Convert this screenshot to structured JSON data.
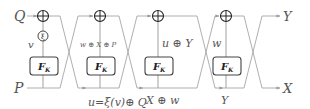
{
  "diagram": {
    "title": "",
    "inputs": {
      "top": "Q",
      "bottom": "P"
    },
    "outputs": {
      "top": "Y",
      "bottom": "X"
    },
    "round_function": {
      "name": "F",
      "subscript": "K"
    },
    "xi_label": "ξ",
    "rounds": [
      {
        "id": 1,
        "xor_x": 43,
        "box_x": 30,
        "vertical_label": "v",
        "bottom_label": "u=ξ(v)⊕ Q"
      },
      {
        "id": 2,
        "xor_x": 100,
        "box_x": 87,
        "vertical_label": "w ⊕ X ⊕ P",
        "bottom_label": ""
      },
      {
        "id": 3,
        "xor_x": 158,
        "box_x": 145,
        "vertical_label": "u ⊕ Y",
        "bottom_label": "X ⊕ w"
      },
      {
        "id": 4,
        "xor_x": 226,
        "box_x": 213,
        "vertical_label": "w",
        "bottom_label": "Y"
      }
    ],
    "colors": {
      "wire": "#9a9a9a",
      "box_stroke": "#444444",
      "text": "#555555"
    }
  }
}
